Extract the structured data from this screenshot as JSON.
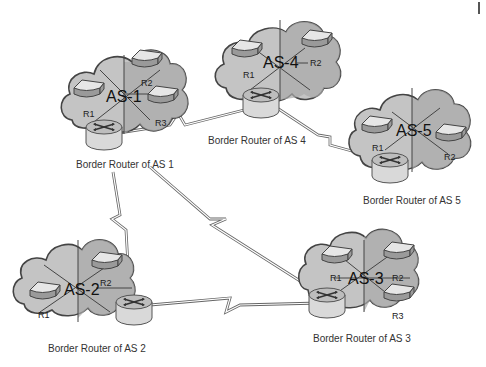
{
  "diagram": {
    "type": "network-topology",
    "colors": {
      "background": "#ffffff",
      "cloud": "#c4c4c4",
      "outline": "#444444",
      "link": "#666666"
    },
    "autonomous_systems": [
      {
        "id": "as1",
        "label": "AS-1",
        "routers": [
          "R1",
          "R2",
          "R3"
        ],
        "border_router_label": "Border Router of AS 1"
      },
      {
        "id": "as2",
        "label": "AS-2",
        "routers": [
          "R1",
          "R2"
        ],
        "border_router_label": "Border Router of AS 2"
      },
      {
        "id": "as3",
        "label": "AS-3",
        "routers": [
          "R1",
          "R2",
          "R3"
        ],
        "border_router_label": "Border Router of AS 3"
      },
      {
        "id": "as4",
        "label": "AS-4",
        "routers": [
          "R1",
          "R2"
        ],
        "border_router_label": "Border Router of AS 4"
      },
      {
        "id": "as5",
        "label": "AS-5",
        "routers": [
          "R1",
          "R2"
        ],
        "border_router_label": "Border Router of AS 5"
      }
    ],
    "links": [
      {
        "from": "AS 1",
        "to": "AS 4",
        "type": "serial"
      },
      {
        "from": "AS 4",
        "to": "AS 5",
        "type": "serial"
      },
      {
        "from": "AS 1",
        "to": "AS 2",
        "type": "serial"
      },
      {
        "from": "AS 1",
        "to": "AS 3",
        "type": "serial"
      },
      {
        "from": "AS 2",
        "to": "AS 3",
        "type": "serial"
      }
    ]
  }
}
